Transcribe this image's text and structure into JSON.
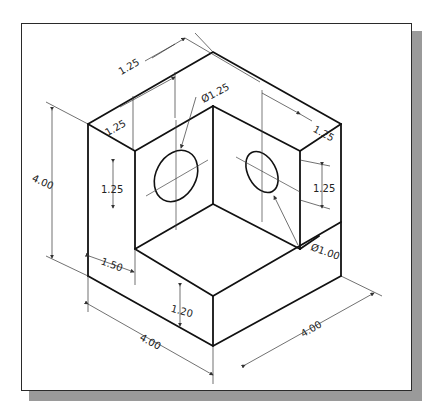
{
  "drawing": {
    "title": "Isometric corner block with two holes",
    "dimensions": {
      "top_depth": "1.25",
      "left_top_width": "1.25",
      "right_top_width": "1.25",
      "height": "4.00",
      "left_hole_offset": "1.25",
      "right_hole_offset": "1.25",
      "left_hole_diameter": "Ø1.25",
      "right_hole_diameter": "Ø1.00",
      "step_width": "1.50",
      "step_height": "1.20",
      "front_length": "4.00",
      "right_length": "4.00"
    },
    "colors": {
      "line": "#111111",
      "frame": "#2a2a2a",
      "shadow": "#9a9a9a",
      "background": "#ffffff"
    }
  }
}
